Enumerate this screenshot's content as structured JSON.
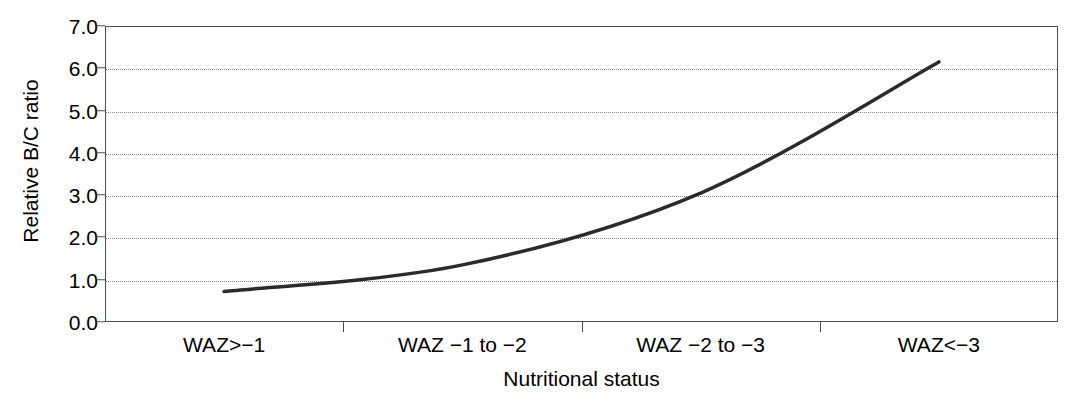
{
  "chart_data": {
    "type": "line",
    "title": "",
    "subtitle": "",
    "xlabel": "Nutritional status",
    "ylabel": "Relative B/C ratio",
    "categories": [
      "WAZ>−1",
      "WAZ −1 to −2",
      "WAZ −2 to −3",
      "WAZ<−3"
    ],
    "series": [
      {
        "name": "Relative B/C ratio",
        "values": [
          0.72,
          1.35,
          3.05,
          6.15
        ],
        "color": "#2b2b2b",
        "line_width": 3.5,
        "markers": "none",
        "smoothing": "spline"
      }
    ],
    "yticks": [
      "0.0",
      "1.0",
      "2.0",
      "3.0",
      "4.0",
      "5.0",
      "6.0",
      "7.0"
    ],
    "ytick_values": [
      0.0,
      1.0,
      2.0,
      3.0,
      4.0,
      5.0,
      6.0,
      7.0
    ],
    "ylim": [
      0.0,
      7.0
    ],
    "xlim": [
      0,
      4
    ],
    "grid": {
      "horizontal": true,
      "vertical": false,
      "style": "dotted",
      "color": "#8a8a8a"
    },
    "legend": {
      "visible": false,
      "position": "none",
      "entries": []
    },
    "frame": {
      "visible": true,
      "color": "#4d4d4d"
    },
    "annotations": []
  },
  "axis": {
    "y_title": "Relative B/C ratio",
    "x_title": "Nutritional status"
  }
}
